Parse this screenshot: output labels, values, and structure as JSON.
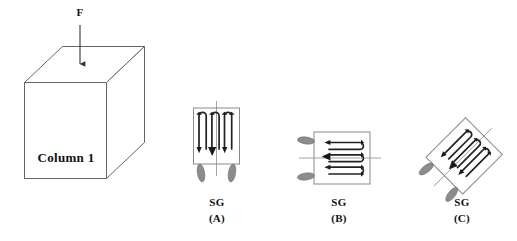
{
  "figure": {
    "type": "engineering-diagram",
    "background_color": "#ffffff",
    "line_color": "#555555",
    "dark_line_color": "#222222",
    "tab_fill_color": "#8c8c8c",
    "grid_fill_color": "#1a1a1a"
  },
  "column": {
    "force_label": "F",
    "body_label": "Column 1"
  },
  "gauges": [
    {
      "name": "SG",
      "id": "(A)",
      "orientation": "vertical",
      "rotation_deg": 0,
      "loops": 4,
      "tab_side": "bottom"
    },
    {
      "name": "SG",
      "id": "(B)",
      "orientation": "horizontal",
      "rotation_deg": 0,
      "loops": 4,
      "tab_side": "left"
    },
    {
      "name": "SG",
      "id": "(C)",
      "orientation": "diagonal",
      "rotation_deg": -45,
      "loops": 4,
      "tab_side": "left"
    }
  ]
}
